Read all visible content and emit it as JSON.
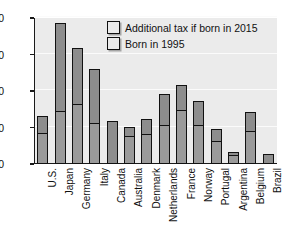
{
  "chart_data": {
    "type": "bar",
    "title": "",
    "subtitle": "",
    "xlabel": "",
    "ylabel": "",
    "ylim": [
      0,
      400
    ],
    "yticks": [
      0,
      100,
      200,
      300,
      400
    ],
    "grid": true,
    "stacked": true,
    "legend_position": "top-right",
    "categories": [
      "U.S.",
      "Japan",
      "Germany",
      "Italy",
      "Canada",
      "Australia",
      "Denmark",
      "Netherlands",
      "France",
      "Norway",
      "Portugal",
      "Argentina",
      "Belgium",
      "Brazil"
    ],
    "series": [
      {
        "name": "Born in 1995",
        "color": "#9a9a9a",
        "values": [
          83,
          142,
          162,
          110,
          118,
          75,
          80,
          105,
          144,
          105,
          60,
          21,
          87,
          27
        ]
      },
      {
        "name": "Additional tax if born in 2015",
        "color": "#8d8d8d",
        "values": [
          49,
          243,
          156,
          151,
          0,
          27,
          42,
          88,
          72,
          67,
          37,
          11,
          56,
          0
        ]
      }
    ],
    "totals": [
      132,
      385,
      318,
      261,
      118,
      102,
      122,
      193,
      216,
      172,
      97,
      32,
      143,
      27
    ]
  },
  "legend": {
    "entries": [
      {
        "label": "Additional tax if born in 2015"
      },
      {
        "label": "Born in 1995"
      }
    ]
  },
  "axis": {
    "ytick_labels": [
      "400",
      "300",
      "200",
      "100",
      "0"
    ]
  },
  "colors": {
    "plot_background": "#ebebeb",
    "page_background": "#ffffff",
    "bar_upper": "#8d8d8d",
    "bar_lower": "#9a9a9a",
    "outline": "#111111",
    "gridline": "#fbfbfb"
  }
}
